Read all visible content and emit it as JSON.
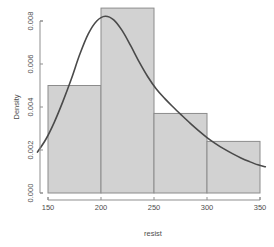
{
  "chart_data": {
    "type": "bar",
    "title": "",
    "xlabel": "resist",
    "ylabel": "Density",
    "xlim": [
      140,
      355
    ],
    "ylim": [
      0,
      0.0088
    ],
    "grid": false,
    "legend": null,
    "xticks": [
      150,
      200,
      250,
      300,
      350
    ],
    "xtick_labels": [
      "150",
      "200",
      "250",
      "300",
      "350"
    ],
    "yticks": [
      0.0,
      0.002,
      0.004,
      0.006,
      0.008
    ],
    "ytick_labels": [
      "0.000",
      "0.002",
      "0.004",
      "0.006",
      "0.008"
    ],
    "bin_edges": [
      150,
      200,
      250,
      300,
      350
    ],
    "categories": [
      "150-200",
      "200-250",
      "250-300",
      "300-350"
    ],
    "values": [
      0.005,
      0.0086,
      0.0037,
      0.0024
    ],
    "series": [
      {
        "name": "Histogram density",
        "type": "bar",
        "values": [
          0.005,
          0.0086,
          0.0037,
          0.0024
        ]
      },
      {
        "name": "Kernel density estimate",
        "type": "line",
        "x": [
          140,
          148,
          156,
          164,
          172,
          180,
          188,
          196,
          204,
          212,
          220,
          228,
          236,
          244,
          252,
          260,
          268,
          276,
          284,
          292,
          300,
          308,
          316,
          324,
          332,
          340,
          348,
          355
        ],
        "y": [
          0.0019,
          0.0025,
          0.0033,
          0.00425,
          0.0053,
          0.00645,
          0.0074,
          0.008,
          0.00822,
          0.00805,
          0.00755,
          0.00685,
          0.0061,
          0.00542,
          0.00485,
          0.0044,
          0.004,
          0.00362,
          0.00325,
          0.0029,
          0.00258,
          0.0023,
          0.00205,
          0.00183,
          0.00163,
          0.00146,
          0.00131,
          0.00122
        ]
      }
    ]
  },
  "axes": {
    "x_title": "resist",
    "y_title": "Density"
  }
}
